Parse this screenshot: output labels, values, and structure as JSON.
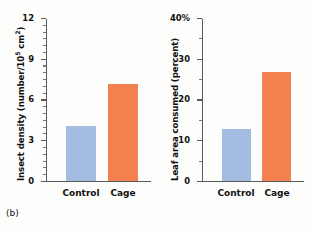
{
  "figure": {
    "panel_label": "(b)",
    "background": "#fdfdfb",
    "colors": {
      "control": "#a3bce0",
      "cage": "#f3804f",
      "axis": "#5a5a5a",
      "text": "#111111"
    }
  },
  "chart_data": [
    {
      "type": "bar",
      "title": "",
      "xlabel": "",
      "ylabel": "Insect density (number/10⁵ cm²)",
      "ylabel_base": "Insect density (number/10",
      "ylabel_exp": "5",
      "ylabel_tail": " cm",
      "ylabel_exp2": "2",
      "ylabel_close": ")",
      "categories": [
        "Control",
        "Cage"
      ],
      "values": [
        4.05,
        7.15
      ],
      "series": [
        {
          "name": "Insect density",
          "values": [
            4.05,
            7.15
          ]
        }
      ],
      "ylim": [
        0,
        12
      ],
      "yticks": [
        0,
        3,
        6,
        9,
        12
      ],
      "ytick_labels": [
        "0",
        "3",
        "6",
        "9",
        "12"
      ],
      "minor_tick_step": 0.5,
      "grid": false,
      "legend": "none",
      "bar_colors": [
        "#a3bce0",
        "#f3804f"
      ]
    },
    {
      "type": "bar",
      "title": "",
      "xlabel": "",
      "ylabel": "Leaf area consumed (percent)",
      "categories": [
        "Control",
        "Cage"
      ],
      "values": [
        12.8,
        26.8
      ],
      "series": [
        {
          "name": "Leaf area consumed",
          "values": [
            12.8,
            26.8
          ]
        }
      ],
      "ylim": [
        0,
        40
      ],
      "yticks": [
        0,
        10,
        20,
        30,
        40
      ],
      "ytick_labels": [
        "0",
        "10",
        "20",
        "30",
        "40%"
      ],
      "minor_tick_step": 5,
      "grid": false,
      "legend": "none",
      "bar_colors": [
        "#a3bce0",
        "#f3804f"
      ]
    }
  ]
}
